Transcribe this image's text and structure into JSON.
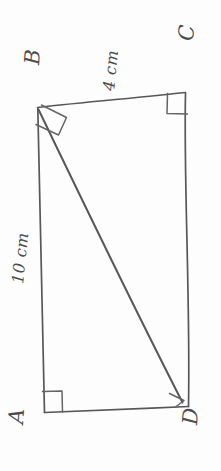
{
  "figure": {
    "kind": "hand-drawn-geometry-sketch",
    "shape": "quadrilateral",
    "orientation_note": "rotated 90 degrees",
    "background_color": "#fdfdfd",
    "stroke_color": "#575757",
    "vertices": [
      {
        "id": "A",
        "label": "A",
        "x": 45,
        "y": 412,
        "right_angle": true
      },
      {
        "id": "B",
        "label": "B",
        "x": 38,
        "y": 107,
        "right_angle": true
      },
      {
        "id": "C",
        "label": "C",
        "x": 185,
        "y": 92,
        "right_angle": true
      },
      {
        "id": "D",
        "label": "D",
        "x": 188,
        "y": 406,
        "right_angle": true
      }
    ],
    "edges": [
      {
        "id": "AB",
        "from": "A",
        "to": "B",
        "kind": "side"
      },
      {
        "id": "BC",
        "from": "B",
        "to": "C",
        "kind": "side"
      },
      {
        "id": "CD",
        "from": "C",
        "to": "D",
        "kind": "side"
      },
      {
        "id": "AD",
        "from": "A",
        "to": "D",
        "kind": "side"
      },
      {
        "id": "BD",
        "from": "B",
        "to": "D",
        "kind": "diagonal"
      }
    ],
    "measurements": [
      {
        "id": "AB",
        "label": "10 cm",
        "value": 10,
        "unit": "cm",
        "edge": "AB"
      },
      {
        "id": "BC",
        "label": "4 cm",
        "value": 4,
        "unit": "cm",
        "edge": "BC"
      }
    ],
    "right_angle_marks": [
      {
        "at": "B",
        "between": [
          "BA",
          "BC"
        ]
      },
      {
        "at": "C",
        "between": [
          "CB",
          "CD"
        ]
      },
      {
        "at": "A",
        "between": [
          "AB",
          "AD"
        ]
      },
      {
        "at": "D",
        "between": [
          "DB",
          "DA"
        ]
      }
    ]
  }
}
